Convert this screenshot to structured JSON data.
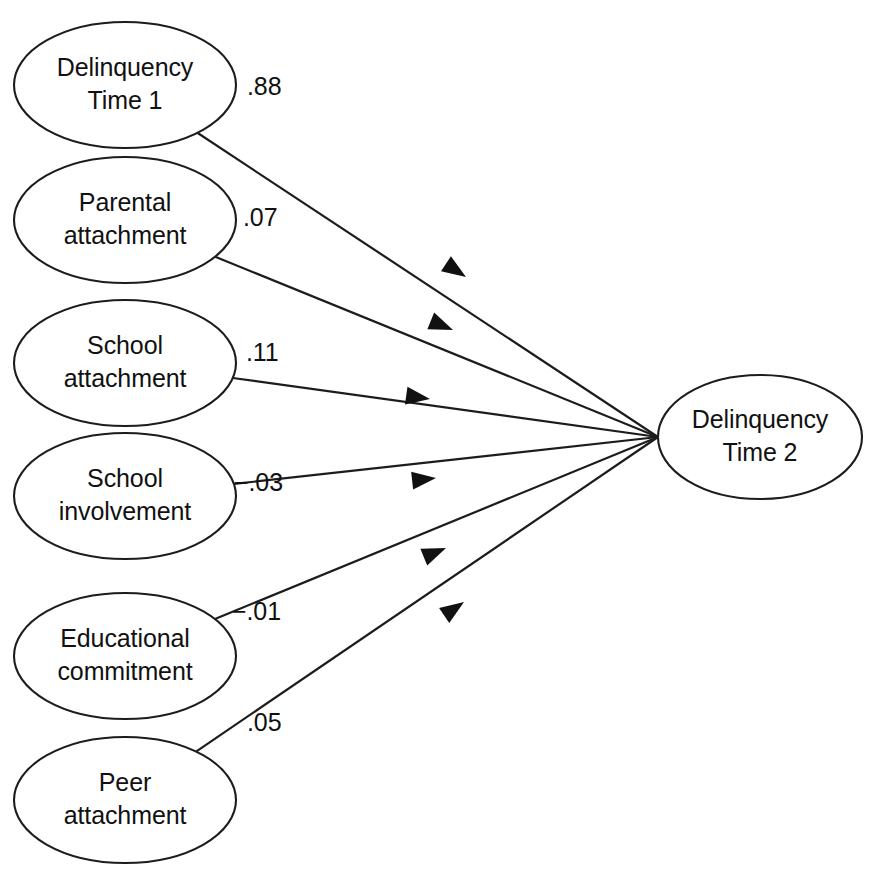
{
  "diagram": {
    "type": "path-diagram",
    "background_color": "#ffffff",
    "stroke_color": "#1c1c1c",
    "text_color": "#111111",
    "predictors": [
      {
        "id": "delinquency-time-1",
        "line1": "Delinquency",
        "line2": "Time 1",
        "coefficient": ".88",
        "cx": 125,
        "cy": 85,
        "rx": 111,
        "ry": 63,
        "label_x": 247,
        "label_y": 88,
        "arrow_x": 466,
        "arrow_y": 277
      },
      {
        "id": "parental-attachment",
        "line1": "Parental",
        "line2": "attachment",
        "coefficient": ".07",
        "cx": 125,
        "cy": 220,
        "rx": 111,
        "ry": 63,
        "label_x": 243,
        "label_y": 219,
        "arrow_x": 453,
        "arrow_y": 330
      },
      {
        "id": "school-attachment",
        "line1": "School",
        "line2": "attachment",
        "coefficient": ".11",
        "cx": 125,
        "cy": 363,
        "rx": 111,
        "ry": 63,
        "label_x": 246,
        "label_y": 354,
        "arrow_x": 430,
        "arrow_y": 399
      },
      {
        "id": "school-involvement",
        "line1": "School",
        "line2": "involvement",
        "coefficient": "−.03",
        "cx": 125,
        "cy": 496,
        "rx": 111,
        "ry": 63,
        "label_x": 234,
        "label_y": 484,
        "arrow_x": 436,
        "arrow_y": 478
      },
      {
        "id": "educational-commitment",
        "line1": "Educational",
        "line2": "commitment",
        "coefficient": "−.01",
        "cx": 125,
        "cy": 656,
        "rx": 111,
        "ry": 63,
        "label_x": 232,
        "label_y": 613,
        "arrow_x": 446,
        "arrow_y": 548
      },
      {
        "id": "peer-attachment",
        "line1": "Peer",
        "line2": "attachment",
        "coefficient": ".05",
        "cx": 125,
        "cy": 800,
        "rx": 111,
        "ry": 63,
        "label_x": 247,
        "label_y": 724,
        "arrow_x": 464,
        "arrow_y": 602
      }
    ],
    "outcome": {
      "id": "delinquency-time-2",
      "line1": "Delinquency",
      "line2": "Time 2",
      "cx": 760,
      "cy": 437,
      "rx": 102,
      "ry": 62,
      "convergence_x": 658,
      "convergence_y": 437
    }
  },
  "chart_data": {
    "type": "diagram",
    "nodes": [
      "Delinquency Time 1",
      "Parental attachment",
      "School attachment",
      "School involvement",
      "Educational commitment",
      "Peer attachment",
      "Delinquency Time 2"
    ],
    "edges": [
      {
        "from": "Delinquency Time 1",
        "to": "Delinquency Time 2",
        "value": 0.88,
        "label": ".88"
      },
      {
        "from": "Parental attachment",
        "to": "Delinquency Time 2",
        "value": 0.07,
        "label": ".07"
      },
      {
        "from": "School attachment",
        "to": "Delinquency Time 2",
        "value": 0.11,
        "label": ".11"
      },
      {
        "from": "School involvement",
        "to": "Delinquency Time 2",
        "value": -0.03,
        "label": "−.03"
      },
      {
        "from": "Educational commitment",
        "to": "Delinquency Time 2",
        "value": -0.01,
        "label": "−.01"
      },
      {
        "from": "Peer attachment",
        "to": "Delinquency Time 2",
        "value": 0.05,
        "label": ".05"
      }
    ]
  }
}
